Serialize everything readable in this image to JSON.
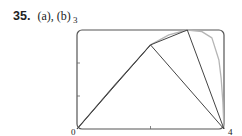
{
  "problem": {
    "number": "35.",
    "parts": "(a), (b)"
  },
  "chart_data": {
    "type": "line",
    "title": "",
    "xlabel": "",
    "ylabel": "",
    "xlim": [
      0,
      4
    ],
    "ylim": [
      0,
      3
    ],
    "x_tick_labels": {
      "0": "0",
      "4": "4"
    },
    "y_tick_labels": {
      "3": "3"
    },
    "x_ticks": [
      0,
      2,
      4
    ],
    "y_ticks": [
      1,
      2,
      3
    ],
    "grid": false,
    "legend": null,
    "series": [
      {
        "name": "curve",
        "color": "#b5b5b5",
        "points": [
          [
            0,
            0
          ],
          [
            1,
            1.3
          ],
          [
            2,
            2.55
          ],
          [
            2.5,
            2.85
          ],
          [
            3,
            3.0
          ],
          [
            3.4,
            2.95
          ],
          [
            3.67,
            2.76
          ],
          [
            3.86,
            2.09
          ],
          [
            3.92,
            1.55
          ],
          [
            3.97,
            0.8
          ],
          [
            4,
            0
          ]
        ]
      },
      {
        "name": "polygon n=2",
        "color": "#444444",
        "points": [
          [
            0,
            0
          ],
          [
            2,
            2.55
          ],
          [
            4,
            0
          ]
        ]
      },
      {
        "name": "polygon n=4",
        "color": "#444444",
        "points": [
          [
            0,
            0
          ],
          [
            1,
            1.3
          ],
          [
            2,
            2.55
          ],
          [
            3,
            3.0
          ],
          [
            4,
            0
          ]
        ]
      }
    ]
  },
  "labels": {
    "x0": "0",
    "x4": "4",
    "y3": "3"
  }
}
